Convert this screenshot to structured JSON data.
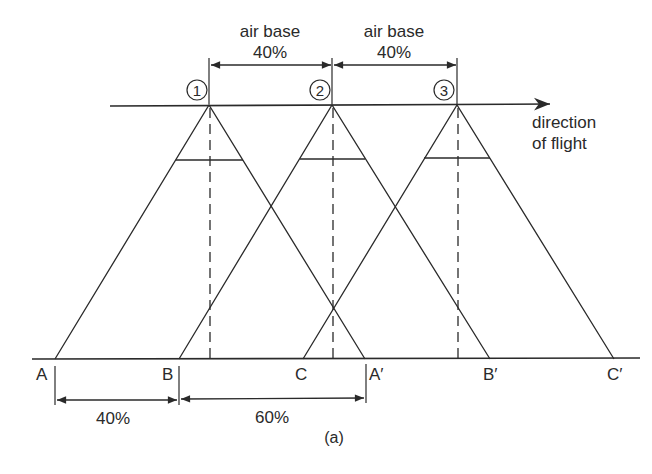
{
  "figure": {
    "caption": "(a)",
    "top_cut_text": "...y ... ... g"
  },
  "air_bases": [
    {
      "label": "air base",
      "value": "40%"
    },
    {
      "label": "air base",
      "value": "40%"
    }
  ],
  "exposure_stations": [
    {
      "label": "①",
      "x": 209
    },
    {
      "label": "②",
      "x": 332
    },
    {
      "label": "③",
      "x": 457
    }
  ],
  "direction": {
    "line1": "direction",
    "line2": "of flight"
  },
  "ground_points": [
    {
      "label": "A",
      "x": 55
    },
    {
      "label": "B",
      "x": 179
    },
    {
      "label": "C",
      "x": 303
    },
    {
      "label": "A′",
      "x": 365
    },
    {
      "label": "B′",
      "x": 490
    },
    {
      "label": "C′",
      "x": 614
    }
  ],
  "ground_dimensions": [
    {
      "label": "40%",
      "from": "A",
      "to": "B"
    },
    {
      "label": "60%",
      "from": "B",
      "to": "A′"
    }
  ],
  "colors": {
    "stroke": "#2a2a2a",
    "background": "#ffffff"
  }
}
